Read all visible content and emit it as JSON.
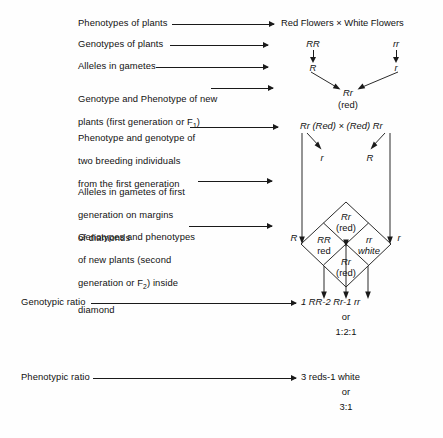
{
  "figure": {
    "title_hidden": "Monohybrid cross diagram (Punnett diamond)",
    "rows": [
      {
        "label": "Phenotypes of plants",
        "value": "Red Flowers × White Flowers"
      },
      {
        "label": "Genotypes of plants",
        "value_left": "RR",
        "value_right": "rr"
      },
      {
        "label": "Alleles in gametes",
        "value_left": "R",
        "value_right": "r"
      },
      {
        "label": "Genotype and Phenotype of new\nplants (first generation or F",
        "label_sub": "1",
        "label_tail": ")",
        "value_center": "Rr",
        "value_center_2": "(red)"
      },
      {
        "label": "Phenotype and genotype of\ntwo breeding individuals\nfrom the first generation",
        "value": "Rr (Red) × (Red) Rr"
      },
      {
        "label": "Alleles in gametes of first\ngeneration on margins\nof diamonds",
        "inner_left": "r",
        "inner_right": "R",
        "edge_left": "R",
        "edge_right": "r"
      },
      {
        "label": "Genotypes and phenotypes\nof new plants (second\ngeneration or F",
        "label_sub": "2",
        "label_tail": ") inside\ndiamond"
      },
      {
        "label": "Genotypic ratio",
        "value": "1 RR-2 Rr-1 rr",
        "or": "or",
        "ratio": "1:2:1"
      },
      {
        "label": "Phenotypic ratio",
        "value": "3 reds-1 white",
        "or": "or",
        "ratio": "3:1"
      }
    ]
  },
  "labels": {
    "phenotypes_of_plants": "Phenotypes of plants",
    "genotypes_of_plants": "Genotypes of plants",
    "alleles_in_gametes": "Alleles in gametes",
    "f1_line1": "Genotype and Phenotype of new",
    "f1_line2_a": "plants (first generation or F",
    "f1_sub": "1",
    "f1_line2_b": ")",
    "breeding_line1": "Phenotype and genotype of",
    "breeding_line2": "two breeding individuals",
    "breeding_line3": "from the first generation",
    "gametes_line1": "Alleles in gametes of first",
    "gametes_line2": "generation on margins",
    "gametes_line3": "of diamonds",
    "f2_line1": "Genotypes and phenotypes",
    "f2_line2": "of new plants (second",
    "f2_line3_a": "generation or F",
    "f2_sub": "2",
    "f2_line3_b": ") inside",
    "f2_line4": "diamond",
    "genotypic_ratio": "Genotypic ratio",
    "phenotypic_ratio": "Phenotypic ratio"
  },
  "values": {
    "parent_phenotypes": "Red Flowers × White Flowers",
    "parent_genotype_left": "RR",
    "parent_genotype_right": "rr",
    "gamete_left": "R",
    "gamete_right": "r",
    "f1_genotype": "Rr",
    "f1_phenotype": "(red)",
    "f1_cross": "Rr (Red) × (Red) Rr",
    "f1_gamete_inner_left": "r",
    "f1_gamete_inner_right": "R",
    "f1_gamete_edge_left": "R",
    "f1_gamete_edge_right": "r",
    "cell_top_genotype": "Rr",
    "cell_top_phenotype": "(red)",
    "cell_left_genotype": "RR",
    "cell_left_phenotype": "red",
    "cell_right_genotype": "rr",
    "cell_right_phenotype": "white",
    "cell_bottom_genotype": "Rr",
    "cell_bottom_phenotype": "(red)",
    "genotypic_ratio_value": "1 RR-2 Rr-1 rr",
    "genotypic_or": "or",
    "genotypic_ratio_numeric": "1:2:1",
    "phenotypic_ratio_value": "3 reds-1 white",
    "phenotypic_or": "or",
    "phenotypic_ratio_numeric": "3:1"
  },
  "colors": {
    "ink": "#111111",
    "line": "#1a1a1a",
    "background": "#fefefe"
  }
}
